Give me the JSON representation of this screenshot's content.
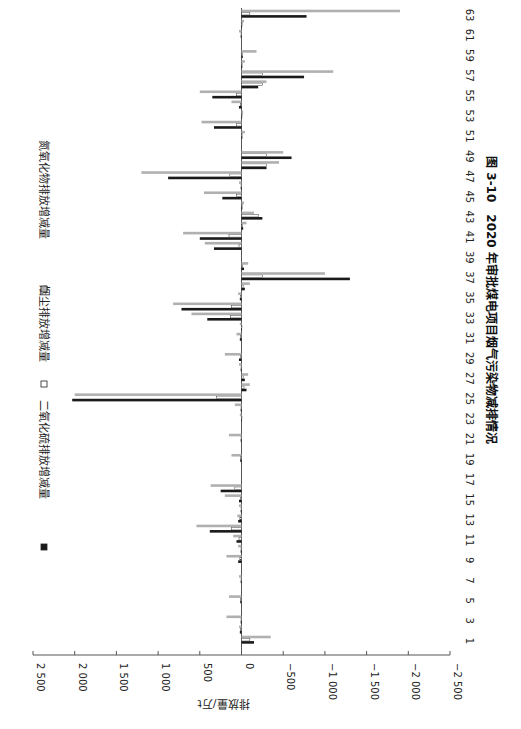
{
  "chart_data": {
    "type": "bar",
    "orientation": "vertical-bars-rotated-90-clockwise",
    "title": "图 3-10　2020 年审批煤电项目烟气污染物减排情况",
    "figure_label": "图 3-10",
    "title_text": "2020 年审批煤电项目烟气污染物减排情况",
    "xlabel": "",
    "ylabel": "排放量/万t",
    "ylim": [
      -2500,
      2500
    ],
    "yticks": [
      2500,
      2000,
      1500,
      1000,
      500,
      0,
      -500,
      -1000,
      -1500,
      -2000,
      -2500
    ],
    "ytick_labels": [
      "2 500",
      "2 000",
      "1 500",
      "1 000",
      "500",
      "0",
      "−500",
      "−1 000",
      "−1 500",
      "−2 000",
      "−2 500"
    ],
    "xtick_labels": [
      "1",
      "3",
      "5",
      "7",
      "9",
      "11",
      "13",
      "15",
      "17",
      "19",
      "21",
      "23",
      "25",
      "27",
      "29",
      "31",
      "33",
      "35",
      "37",
      "39",
      "41",
      "43",
      "45",
      "47",
      "49",
      "51",
      "53",
      "55",
      "57",
      "59",
      "61",
      "63"
    ],
    "grid": false,
    "legend_position": "top (left in rotated view)",
    "categories": [
      1,
      2,
      3,
      4,
      5,
      6,
      7,
      8,
      9,
      10,
      11,
      12,
      13,
      14,
      15,
      16,
      17,
      18,
      19,
      20,
      21,
      22,
      23,
      24,
      25,
      26,
      27,
      28,
      29,
      30,
      31,
      32,
      33,
      34,
      35,
      36,
      37,
      38,
      39,
      40,
      41,
      42,
      43,
      44,
      45,
      46,
      47,
      48,
      49,
      50,
      51,
      52,
      53,
      54,
      55,
      56,
      57,
      58,
      59,
      60,
      61,
      62,
      63
    ],
    "series": [
      {
        "name": "二氧化硫排放增减量",
        "color": "#1a1a1a",
        "values": [
          -150,
          20,
          10,
          0,
          15,
          0,
          10,
          0,
          40,
          10,
          60,
          380,
          40,
          10,
          30,
          250,
          0,
          0,
          15,
          0,
          10,
          0,
          5,
          10,
          2030,
          -60,
          -40,
          10,
          30,
          0,
          20,
          5,
          410,
          720,
          20,
          -40,
          -1300,
          -30,
          0,
          330,
          500,
          -20,
          -250,
          -10,
          230,
          10,
          880,
          -300,
          -600,
          0,
          -10,
          330,
          -5,
          30,
          350,
          -200,
          -750,
          -10,
          -15,
          0,
          10,
          -5,
          -780
        ]
      },
      {
        "name": "烟尘排放增减量",
        "color": "#ffffff",
        "values": [
          -100,
          10,
          5,
          0,
          10,
          0,
          5,
          0,
          20,
          5,
          30,
          120,
          20,
          5,
          10,
          80,
          0,
          0,
          10,
          0,
          5,
          0,
          2,
          5,
          300,
          -30,
          -20,
          5,
          15,
          0,
          10,
          2,
          130,
          120,
          10,
          -20,
          -250,
          -15,
          0,
          30,
          150,
          -10,
          -200,
          -5,
          60,
          5,
          140,
          -300,
          -300,
          0,
          -5,
          60,
          -2,
          15,
          60,
          -250,
          -250,
          -5,
          -10,
          0,
          5,
          -2,
          -100
        ]
      },
      {
        "name": "氮氧化物排放增减量",
        "color": "#b0b0b0",
        "values": [
          -350,
          30,
          180,
          0,
          150,
          0,
          30,
          0,
          180,
          40,
          100,
          540,
          50,
          30,
          200,
          370,
          0,
          0,
          120,
          0,
          150,
          0,
          20,
          80,
          2000,
          -100,
          -80,
          30,
          200,
          0,
          60,
          20,
          600,
          820,
          40,
          -100,
          -1000,
          -80,
          0,
          440,
          700,
          -60,
          -150,
          -30,
          450,
          30,
          1200,
          -450,
          -500,
          0,
          -40,
          480,
          -20,
          120,
          500,
          -300,
          -1100,
          -40,
          -180,
          0,
          30,
          -30,
          -1900
        ]
      }
    ]
  },
  "legend": {
    "items": [
      {
        "label": "二氧化硫排放增减量",
        "swatch": "#1a1a1a"
      },
      {
        "label": "烟尘排放增减量",
        "swatch": "#ffffff"
      },
      {
        "label": "氮氧化物排放增减量",
        "swatch": "#b0b0b0"
      }
    ]
  },
  "axis": {
    "ylabel": "排放量/万t"
  },
  "caption": {
    "figure_label": "图 3-10",
    "title": "2020 年审批煤电项目烟气污染物减排情况"
  }
}
